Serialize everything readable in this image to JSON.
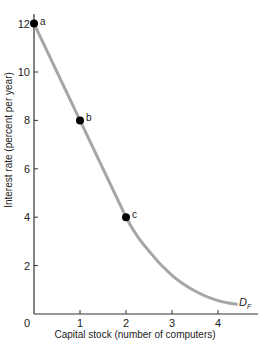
{
  "chart_data": {
    "type": "line",
    "title": "",
    "xlabel": "Capital stock (number of computers)",
    "ylabel": "Interest rate (percent per year)",
    "xlim": [
      0,
      4.6
    ],
    "ylim": [
      0,
      12.6
    ],
    "grid": false,
    "x_ticks": [
      "0",
      "1",
      "2",
      "3",
      "4"
    ],
    "y_ticks": [
      "2",
      "4",
      "6",
      "8",
      "10",
      "12"
    ],
    "series": [
      {
        "name": "D_F",
        "label_main": "D",
        "label_sub": "F",
        "color": "#a6a6a6",
        "x": [
          0,
          1,
          2,
          2.5,
          3,
          3.5,
          4,
          4.4
        ],
        "y": [
          12,
          8,
          4,
          2.6,
          1.6,
          0.95,
          0.55,
          0.4
        ]
      }
    ],
    "points": [
      {
        "label": "a",
        "x": 0,
        "y": 12
      },
      {
        "label": "b",
        "x": 1,
        "y": 8
      },
      {
        "label": "c",
        "x": 2,
        "y": 4
      }
    ]
  }
}
